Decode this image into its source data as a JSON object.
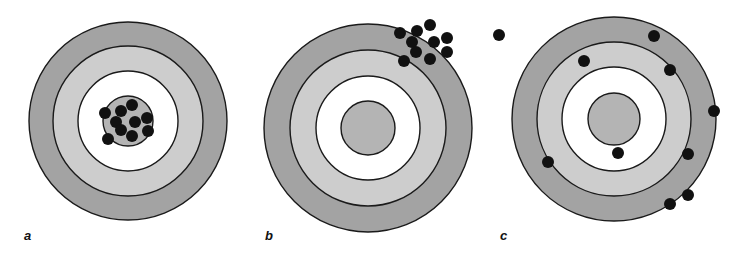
{
  "colors": {
    "background": "#ffffff",
    "outer_ring": "#a3a3a3",
    "middle_ring": "#cdcdcd",
    "inner_ring": "#ffffff",
    "bullseye": "#b4b4b4",
    "ring_stroke": "#1a1a1a",
    "shot": "#111111"
  },
  "panels": [
    {
      "label": "a",
      "label_pos": [
        24,
        229
      ],
      "center": [
        128,
        121
      ],
      "radii": [
        99,
        75,
        50,
        25
      ],
      "shots": [
        [
          105,
          113
        ],
        [
          121,
          111
        ],
        [
          132,
          105
        ],
        [
          116,
          122
        ],
        [
          135,
          122
        ],
        [
          147,
          118
        ],
        [
          121,
          130
        ],
        [
          148,
          131
        ],
        [
          132,
          136
        ],
        [
          108,
          139
        ]
      ]
    },
    {
      "label": "b",
      "label_pos": [
        265,
        229
      ],
      "center": [
        368,
        128
      ],
      "radii": [
        104,
        78,
        52,
        27
      ],
      "shots": [
        [
          400,
          33
        ],
        [
          417,
          31
        ],
        [
          430,
          25
        ],
        [
          412,
          42
        ],
        [
          434,
          42
        ],
        [
          447,
          38
        ],
        [
          416,
          52
        ],
        [
          447,
          52
        ],
        [
          430,
          59
        ],
        [
          404,
          61
        ]
      ]
    },
    {
      "label": "c",
      "label_pos": [
        500,
        229
      ],
      "center": [
        614,
        119
      ],
      "radii": [
        102,
        77,
        52,
        26
      ],
      "shots": [
        [
          499,
          35
        ],
        [
          654,
          36
        ],
        [
          584,
          61
        ],
        [
          670,
          70
        ],
        [
          714,
          111
        ],
        [
          618,
          153
        ],
        [
          688,
          154
        ],
        [
          548,
          162
        ],
        [
          688,
          195
        ],
        [
          670,
          204
        ]
      ]
    }
  ],
  "shot_radius": 6
}
